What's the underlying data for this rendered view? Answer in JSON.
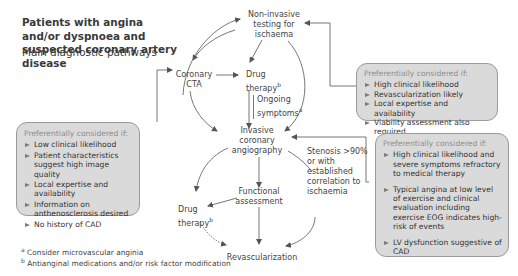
{
  "header": {
    "title": "Patients with angina and/or dyspnoea and suspected coronary artery disease",
    "subtitle": "Main diagnostic pathways"
  },
  "nodes": {
    "non_invasive": "Non-invasive testing for ischaema",
    "coronary_cta": "Coronary CTA",
    "drug_therapy_top": "Drug therapy",
    "drug_therapy_top_sup": "b",
    "ongoing_symptoms": "Ongoing symptoms",
    "ongoing_symptoms_sup": "a",
    "invasive_angiography": "Invasive coronary angiography",
    "stenosis": "Stenosis >90% or with established correlation to ischaemia",
    "functional_assessment": "Functional assessment",
    "drug_therapy_bottom": "Drug therapy",
    "drug_therapy_bottom_sup": "b",
    "revascularization": "Revascularization"
  },
  "boxes": {
    "cta": {
      "header": "Preferentially considered if:",
      "items": [
        "Low clinical likelihood",
        "Patient characteristics suggest high image quality",
        "Local expertise and availability",
        "Information on anthenosclerosis desired",
        "No history of CAD"
      ]
    },
    "non_invasive": {
      "header": "Preferentially considered if:",
      "items": [
        "High clinical likelihood",
        "Revascularization likely",
        "Local expertise and availability",
        "Viability assessment also required"
      ]
    },
    "invasive": {
      "header": "Preferentially considered if:",
      "items": [
        "High clinical likelihood and severe symptoms refractory to medical therapy",
        "Typical angina at low level of exercise and clinical evaluation including exercise EOG indicates high-risk of events",
        "LV dysfunction suggestive of CAD"
      ]
    }
  },
  "footnotes": [
    {
      "mark": "a",
      "text": "Consider microvascular anginia"
    },
    {
      "mark": "b",
      "text": "Antianginal medications and/or risk factor modification"
    }
  ],
  "colors": {
    "box_fill": "#dadada",
    "box_border": "#9a9a9a",
    "arrow": "#555555",
    "text": "#333333"
  }
}
